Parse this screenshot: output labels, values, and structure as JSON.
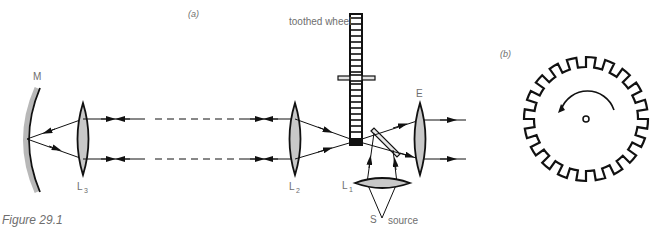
{
  "figure": {
    "caption": "Figure 29.1",
    "panel_a_label": "(a)",
    "panel_b_label": "(b)"
  },
  "labels": {
    "mirror": "M",
    "lens_l3": "L",
    "lens_l3_sub": "3",
    "lens_l2": "L",
    "lens_l2_sub": "2",
    "lens_l1": "L",
    "lens_l1_sub": "1",
    "eyepiece": "E",
    "toothed_wheel": "toothed wheel",
    "source_point": "S",
    "source": "source"
  },
  "colors": {
    "line": "#111111",
    "lens_fill": "#c8c8c8",
    "mirror_fill": "#b8b8b8",
    "label": "#6e6e6e"
  },
  "gear": {
    "teeth": 20,
    "rotation": "counterclockwise"
  }
}
